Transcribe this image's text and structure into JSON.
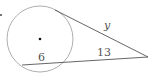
{
  "diagram": {
    "type": "circle-tangent-secant",
    "labels": {
      "tangent": "y",
      "secant_external": "13",
      "secant_internal": "6"
    },
    "colors": {
      "stroke": "#555555",
      "circle_stroke": "#999999",
      "point": "#111111"
    }
  }
}
